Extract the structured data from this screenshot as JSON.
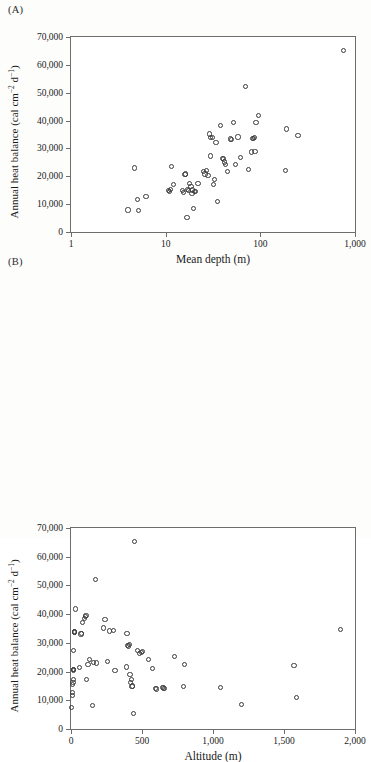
{
  "figure": {
    "background": "#fdfdfc",
    "marker_color": "#3a3a3a",
    "axis_color": "#6d6d6d"
  },
  "panels": [
    {
      "id": "A",
      "label": "(A)"
    },
    {
      "id": "B",
      "label": "(B)"
    }
  ],
  "chart_data": [
    {
      "type": "scatter",
      "panel": "(A)",
      "title": "",
      "xlabel": "Mean depth (m)",
      "ylabel": "Annual heat balance (cal cm−2 d−1)",
      "ylabel_parts": {
        "pre": "Annual heat balance (cal cm",
        "sup1": "−2",
        "mid": " d",
        "sup2": "−1",
        "post": ")"
      },
      "xscale": "log",
      "yscale": "linear",
      "xlim": [
        1,
        1000
      ],
      "ylim": [
        0,
        70000
      ],
      "grid": false,
      "legend": null,
      "xticks": [
        1,
        10,
        100,
        1000
      ],
      "xticklabels": [
        "1",
        "10",
        "100",
        "1,000"
      ],
      "yticks": [
        0,
        10000,
        20000,
        30000,
        40000,
        50000,
        60000,
        70000
      ],
      "yticklabels": [
        "0",
        "10,000",
        "20,000",
        "30,000",
        "40,000",
        "50,000",
        "60,000",
        "70,000"
      ],
      "points": [
        [
          4.0,
          7900
        ],
        [
          4.7,
          23000
        ],
        [
          5.0,
          11800
        ],
        [
          5.2,
          7600
        ],
        [
          6.2,
          12700
        ],
        [
          10.8,
          15000
        ],
        [
          11.0,
          14400
        ],
        [
          11.3,
          15300
        ],
        [
          11.6,
          23400
        ],
        [
          12.0,
          17000
        ],
        [
          15.0,
          15000
        ],
        [
          15.5,
          14200
        ],
        [
          16.0,
          20600
        ],
        [
          16.3,
          20800
        ],
        [
          16.8,
          5300
        ],
        [
          17.0,
          15200
        ],
        [
          17.5,
          14900
        ],
        [
          18.0,
          17400
        ],
        [
          18.5,
          16200
        ],
        [
          19.0,
          13700
        ],
        [
          19.3,
          15100
        ],
        [
          19.8,
          8400
        ],
        [
          20.0,
          14400
        ],
        [
          20.5,
          14600
        ],
        [
          22.0,
          17300
        ],
        [
          25.0,
          21600
        ],
        [
          26.0,
          20800
        ],
        [
          27.0,
          22200
        ],
        [
          28.0,
          20400
        ],
        [
          29.0,
          35200
        ],
        [
          29.5,
          27300
        ],
        [
          30.0,
          34000
        ],
        [
          31.0,
          33800
        ],
        [
          32.0,
          17100
        ],
        [
          33.0,
          18900
        ],
        [
          34.0,
          32200
        ],
        [
          35.0,
          11000
        ],
        [
          38.0,
          38100
        ],
        [
          40.0,
          26400
        ],
        [
          41.0,
          26200
        ],
        [
          42.0,
          25100
        ],
        [
          43.0,
          24300
        ],
        [
          45.0,
          21700
        ],
        [
          48.0,
          33400
        ],
        [
          50.0,
          33200
        ],
        [
          52.0,
          39200
        ],
        [
          55.0,
          24200
        ],
        [
          58.0,
          34100
        ],
        [
          62.0,
          26700
        ],
        [
          70.0,
          52200
        ],
        [
          75.0,
          22500
        ],
        [
          80.0,
          28700
        ],
        [
          82.0,
          33700
        ],
        [
          84.0,
          33600
        ],
        [
          86.0,
          33800
        ],
        [
          88.0,
          28900
        ],
        [
          90.0,
          39400
        ],
        [
          95.0,
          41800
        ],
        [
          185.0,
          22100
        ],
        [
          190.0,
          37000
        ],
        [
          250.0,
          34700
        ],
        [
          760.0,
          65200
        ]
      ]
    },
    {
      "type": "scatter",
      "panel": "(B)",
      "title": "",
      "xlabel": "Altitude (m)",
      "ylabel": "Annual heat balance (cal cm−2 d−1)",
      "ylabel_parts": {
        "pre": "Annual heat balance (cal cm",
        "sup1": "−2",
        "mid": " d",
        "sup2": "−1",
        "post": ")"
      },
      "xscale": "linear",
      "yscale": "linear",
      "xlim": [
        0,
        2000
      ],
      "ylim": [
        0,
        70000
      ],
      "grid": false,
      "legend": null,
      "xticks": [
        0,
        500,
        1000,
        1500,
        2000
      ],
      "xticklabels": [
        "0",
        "500",
        "1,000",
        "1,500",
        "2,000"
      ],
      "yticks": [
        0,
        10000,
        20000,
        30000,
        40000,
        50000,
        60000,
        70000
      ],
      "yticklabels": [
        "0",
        "10,000",
        "20,000",
        "30,000",
        "40,000",
        "50,000",
        "60,000",
        "70,000"
      ],
      "points": [
        [
          5,
          7600
        ],
        [
          8,
          11800
        ],
        [
          10,
          12700
        ],
        [
          12,
          15600
        ],
        [
          14,
          16200
        ],
        [
          15,
          17200
        ],
        [
          16,
          20400
        ],
        [
          17,
          20600
        ],
        [
          18,
          20800
        ],
        [
          20,
          27300
        ],
        [
          22,
          33600
        ],
        [
          24,
          33800
        ],
        [
          26,
          34000
        ],
        [
          30,
          41800
        ],
        [
          60,
          21400
        ],
        [
          70,
          33100
        ],
        [
          75,
          33400
        ],
        [
          80,
          37000
        ],
        [
          95,
          38600
        ],
        [
          100,
          39200
        ],
        [
          105,
          39400
        ],
        [
          110,
          17300
        ],
        [
          120,
          22500
        ],
        [
          130,
          24200
        ],
        [
          150,
          8200
        ],
        [
          160,
          23100
        ],
        [
          170,
          52200
        ],
        [
          180,
          23000
        ],
        [
          230,
          35200
        ],
        [
          240,
          38100
        ],
        [
          255,
          23400
        ],
        [
          270,
          34100
        ],
        [
          300,
          34200
        ],
        [
          310,
          20400
        ],
        [
          390,
          21600
        ],
        [
          395,
          33400
        ],
        [
          400,
          29100
        ],
        [
          405,
          28900
        ],
        [
          410,
          29400
        ],
        [
          415,
          18900
        ],
        [
          420,
          16100
        ],
        [
          425,
          17100
        ],
        [
          430,
          14800
        ],
        [
          432,
          15000
        ],
        [
          440,
          5300
        ],
        [
          445,
          65200
        ],
        [
          470,
          27300
        ],
        [
          480,
          26400
        ],
        [
          495,
          26700
        ],
        [
          505,
          27000
        ],
        [
          545,
          24300
        ],
        [
          575,
          21000
        ],
        [
          595,
          14200
        ],
        [
          600,
          13900
        ],
        [
          645,
          14400
        ],
        [
          650,
          14300
        ],
        [
          660,
          14200
        ],
        [
          730,
          25200
        ],
        [
          790,
          14900
        ],
        [
          800,
          22400
        ],
        [
          1055,
          14500
        ],
        [
          1200,
          8500
        ],
        [
          1570,
          22000
        ],
        [
          1590,
          11000
        ],
        [
          1900,
          34700
        ]
      ]
    }
  ]
}
